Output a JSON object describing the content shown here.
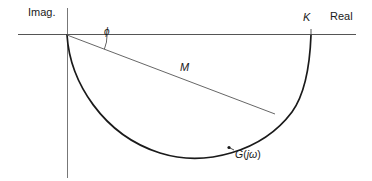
{
  "figure": {
    "labels": {
      "imaginary_axis": "Imag.",
      "real_axis": "Real",
      "gain_k": "K",
      "magnitude": "M",
      "phase_angle": "ϕ",
      "transfer_function": "G",
      "transfer_function_arg_open": "(",
      "transfer_function_arg": "jω",
      "transfer_function_arg_close": ")"
    },
    "colors": {
      "axis": "#4d4d4d",
      "curve": "#1a1a1a",
      "vector": "#555555",
      "text": "#1a1a1a",
      "background": "#ffffff"
    },
    "geometry": {
      "origin": {
        "x": 67,
        "y": 35
      },
      "k_point": {
        "x": 311,
        "y": 35
      },
      "g_point": {
        "x": 274,
        "y": 113
      },
      "g_marker": {
        "x": 229,
        "y": 147
      },
      "real_axis_extent": {
        "x1": 18,
        "x2": 356,
        "y": 35
      },
      "imag_axis_extent": {
        "y1": 8,
        "y2": 178,
        "x": 67
      },
      "curve_lowest_y": 159,
      "phase_arc_radius": 40
    }
  }
}
